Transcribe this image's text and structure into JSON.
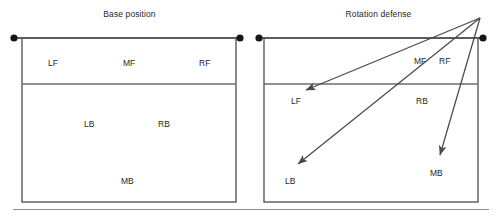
{
  "figure": {
    "type": "diagram",
    "panel_count": 2
  },
  "panels": [
    {
      "id": "base-position",
      "title": "Base position",
      "court": {
        "left": 22,
        "right": 236,
        "top": 38,
        "bottom": 202,
        "attack_line_y": 84
      },
      "net_dots": [
        {
          "x": 14,
          "y": 38
        },
        {
          "x": 240,
          "y": 38
        }
      ],
      "labels": [
        {
          "name": "LF",
          "text": "LF",
          "x": 48,
          "y": 58
        },
        {
          "name": "MF",
          "text": "MF",
          "x": 123,
          "y": 58
        },
        {
          "name": "RF",
          "text": "RF",
          "x": 199,
          "y": 58
        },
        {
          "name": "LB",
          "text": "LB",
          "x": 84,
          "y": 119
        },
        {
          "name": "RB",
          "text": "RB",
          "x": 158,
          "y": 119
        },
        {
          "name": "MB",
          "text": "MB",
          "x": 121,
          "y": 176
        }
      ],
      "arrows": []
    },
    {
      "id": "rotation-defense",
      "title": "Rotation defense",
      "court": {
        "left": 14,
        "right": 228,
        "top": 38,
        "bottom": 202,
        "attack_line_y": 84
      },
      "net_dots": [
        {
          "x": 9,
          "y": 38
        },
        {
          "x": 233,
          "y": 38
        }
      ],
      "labels": [
        {
          "name": "MF",
          "text": "MF",
          "x": 164,
          "y": 56
        },
        {
          "name": "RF",
          "text": "RF",
          "x": 189,
          "y": 56
        },
        {
          "name": "LF",
          "text": "LF",
          "x": 41,
          "y": 96
        },
        {
          "name": "RB",
          "text": "RB",
          "x": 166,
          "y": 96
        },
        {
          "name": "LB",
          "text": "LB",
          "x": 35,
          "y": 176
        },
        {
          "name": "MB",
          "text": "MB",
          "x": 180,
          "y": 168
        }
      ],
      "arrows": [
        {
          "name": "arrow-to-lf",
          "from_x": 230,
          "from_y": 18,
          "to_x": 56,
          "to_y": 90,
          "target": "LF"
        },
        {
          "name": "arrow-to-lb",
          "from_x": 230,
          "from_y": 18,
          "to_x": 48,
          "to_y": 164,
          "target": "LB"
        },
        {
          "name": "arrow-to-mb",
          "from_x": 230,
          "from_y": 18,
          "to_x": 190,
          "to_y": 155,
          "target": "MB"
        }
      ]
    }
  ],
  "style": {
    "court_line_color": "#5a5a5a",
    "attack_line_color": "#6d6d6d",
    "arrow_color": "#4a4a4a",
    "dot_color": "#161616",
    "net_line_color": "#2b2b2b",
    "rule_color": "#8d8d8d",
    "text_color": "#1f1f1f"
  }
}
